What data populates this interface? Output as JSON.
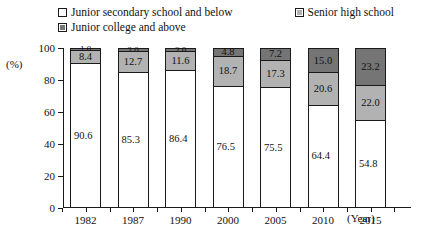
{
  "legend": {
    "items": [
      {
        "label": "Junior secondary school and below",
        "swatch": "white"
      },
      {
        "label": "Senior high school",
        "swatch": "mid"
      },
      {
        "label": "Junior college and above",
        "swatch": "dark"
      }
    ]
  },
  "axis": {
    "y_unit": "(%)",
    "y_ticks": [
      "0",
      "20",
      "40",
      "60",
      "80",
      "100"
    ],
    "x_unit": "(Year)"
  },
  "chart_data": {
    "type": "bar",
    "title": "",
    "xlabel": "(Year)",
    "ylabel": "(%)",
    "ylim": [
      0,
      100
    ],
    "grid": false,
    "stacked": true,
    "legend_position": "top",
    "categories": [
      "1982",
      "1987",
      "1990",
      "2000",
      "2005",
      "2010",
      "2015"
    ],
    "series": [
      {
        "name": "Junior secondary school and below",
        "color": "#ffffff",
        "values": [
          90.6,
          85.3,
          86.4,
          76.5,
          75.5,
          64.4,
          54.8
        ]
      },
      {
        "name": "Senior high school",
        "color": "#b2b2b2",
        "values": [
          8.4,
          12.7,
          11.6,
          18.7,
          17.3,
          20.6,
          22.0
        ]
      },
      {
        "name": "Junior college and above",
        "color": "#757575",
        "values": [
          1.0,
          2.0,
          2.0,
          4.8,
          7.2,
          15.0,
          23.2
        ]
      }
    ],
    "value_labels": {
      "1982": {
        "junior_secondary": "90.6",
        "senior_high": "8.4",
        "junior_college": "1.0"
      },
      "1987": {
        "junior_secondary": "85.3",
        "senior_high": "12.7",
        "junior_college": "2.0"
      },
      "1990": {
        "junior_secondary": "86.4",
        "senior_high": "11.6",
        "junior_college": "2.0"
      },
      "2000": {
        "junior_secondary": "76.5",
        "senior_high": "18.7",
        "junior_college": "4.8"
      },
      "2005": {
        "junior_secondary": "75.5",
        "senior_high": "17.3",
        "junior_college": "7.2"
      },
      "2010": {
        "junior_secondary": "64.4",
        "senior_high": "20.6",
        "junior_college": "15.0"
      },
      "2015": {
        "junior_secondary": "54.8",
        "senior_high": "22.0",
        "junior_college": "23.2"
      }
    }
  }
}
